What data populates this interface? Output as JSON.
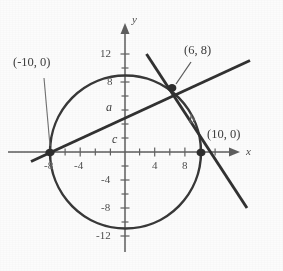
{
  "figure": {
    "type": "coordinate-geometry-diagram",
    "axes": {
      "x_label": "x",
      "y_label": "y",
      "x_ticks": [
        "-8",
        "-4",
        "4",
        "8"
      ],
      "y_ticks": [
        "12",
        "8",
        "-4",
        "-8",
        "-12"
      ],
      "x_tick_values": [
        -8,
        -4,
        4,
        8
      ],
      "y_tick_values": [
        12,
        8,
        -4,
        -8,
        -12
      ],
      "x_range": [
        -11.5,
        12.5
      ],
      "y_range": [
        -13.5,
        14
      ],
      "minor_tick_step": 2,
      "grid": false
    },
    "point_labels": [
      {
        "id": "left-intercept",
        "text": "(-10, 0)",
        "x": -10,
        "y": 0,
        "has_leader": true
      },
      {
        "id": "intersection",
        "text": "(6, 8)",
        "x": 6,
        "y": 8,
        "has_leader": true
      },
      {
        "id": "right-intercept",
        "text": "(10, 0)",
        "x": 10,
        "y": 0,
        "has_leader": false
      }
    ],
    "curve_labels": [
      {
        "id": "line-a",
        "text": "a",
        "meaning": "secant through (-10, 0) and (6, 8)"
      },
      {
        "id": "line-b",
        "text": "b",
        "meaning": "secant through (6, 8) and (10, 0)"
      },
      {
        "id": "segment-c",
        "text": "c",
        "meaning": "segment along the x-axis"
      }
    ],
    "circle": {
      "center_x": 0,
      "center_y": 0,
      "radius": 10
    },
    "lines": [
      {
        "name": "a",
        "through": [
          [
            -10,
            0
          ],
          [
            6,
            8
          ]
        ],
        "slope": 0.5,
        "intercept": 5
      },
      {
        "name": "b",
        "through": [
          [
            6,
            8
          ],
          [
            10,
            0
          ]
        ],
        "slope": -2,
        "intercept": 20
      }
    ],
    "colors": {
      "ink": "#3a3a3a",
      "axis": "#6a6a6a",
      "background": "#ffffff"
    }
  }
}
